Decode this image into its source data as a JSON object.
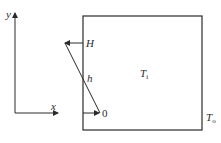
{
  "diagram": {
    "axes": {
      "y_label": "y",
      "x_label": "x"
    },
    "profile": {
      "top_label": "H",
      "mid_label": "h",
      "bottom_label": "0"
    },
    "box": {
      "inside_label_main": "T",
      "inside_label_sub": "i",
      "outside_label_main": "T",
      "outside_label_sub": "o"
    },
    "colors": {
      "line": "#2a2a2a",
      "background": "#ffffff"
    }
  }
}
